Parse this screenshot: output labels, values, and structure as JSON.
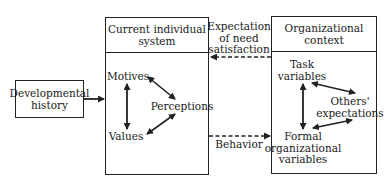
{
  "diagram": {
    "nodes": {
      "developmental_history": {
        "label_line1": "Developmental",
        "label_line2": "history"
      },
      "individual_system": {
        "title_line1": "Current individual",
        "title_line2": "system",
        "elements": {
          "motives": "Motives",
          "perceptions": "Perceptions",
          "values": "Values"
        }
      },
      "organizational_context": {
        "title_line1": "Organizational",
        "title_line2": "context",
        "elements": {
          "task_line1": "Task",
          "task_line2": "variables",
          "others_line1": "Others'",
          "others_line2": "expectations",
          "formal_line1": "Formal",
          "formal_line2": "organizational",
          "formal_line3": "variables"
        }
      }
    },
    "edges": {
      "expectation_line1": "Expectation",
      "expectation_line2": "of need",
      "expectation_line3": "satisfaction",
      "behavior": "Behavior"
    },
    "colors": {
      "line": "#222222",
      "background": "#ffffff"
    }
  }
}
